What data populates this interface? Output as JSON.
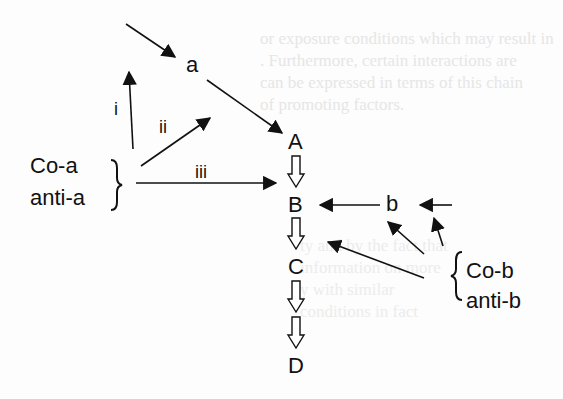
{
  "diagram": {
    "nodes": {
      "a": "a",
      "A": "A",
      "B": "B",
      "C": "C",
      "D": "D",
      "b": "b"
    },
    "agents_left": [
      "Co-a",
      "anti-a"
    ],
    "agents_right": [
      "Co-b",
      "anti-b"
    ],
    "pathway_labels": [
      "i",
      "ii",
      "iii"
    ],
    "bleed_through_text": [
      "or exposure conditions which may result in",
      ". Furthermore, certain interactions are",
      "can be expressed in terms of this chain",
      "of promoting factors."
    ],
    "bleed_through_text_2": [
      "ty and by the fact that",
      "information on more",
      "y with similar",
      "conditions in fact"
    ]
  }
}
